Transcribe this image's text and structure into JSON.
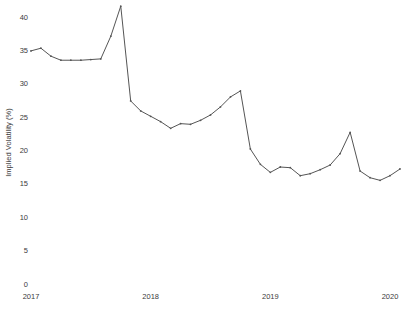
{
  "chart_data": {
    "type": "line",
    "title": "",
    "xlabel": "",
    "ylabel": "Implied Volatility (%)",
    "ylim": [
      0,
      42.5
    ],
    "yticks": [
      0,
      5,
      10,
      15,
      20,
      25,
      30,
      35,
      40
    ],
    "ytick_labels": [
      "0",
      "5",
      "10",
      "15",
      "20",
      "25",
      "30",
      "35",
      "40"
    ],
    "xlim": [
      2017.0,
      2020.08
    ],
    "xticks": [
      2017,
      2018,
      2019,
      2020
    ],
    "xtick_labels": [
      "2017",
      "2018",
      "2019",
      "2020"
    ],
    "grid": false,
    "legend": "none",
    "marker": "point",
    "line_color": "#555555",
    "background_color": "#ffffff",
    "series": [
      {
        "name": "Implied Volatility",
        "x": [
          2017.0,
          2017.083,
          2017.167,
          2017.25,
          2017.333,
          2017.417,
          2017.5,
          2017.583,
          2017.667,
          2017.75,
          2017.833,
          2017.917,
          2018.0,
          2018.083,
          2018.167,
          2018.25,
          2018.333,
          2018.417,
          2018.5,
          2018.583,
          2018.667,
          2018.75,
          2018.833,
          2018.917,
          2019.0,
          2019.083,
          2019.167,
          2019.25,
          2019.333,
          2019.417,
          2019.5,
          2019.583,
          2019.667,
          2019.75,
          2019.833,
          2019.917,
          2020.0,
          2020.083
        ],
        "values": [
          35.0,
          35.4,
          34.2,
          33.6,
          33.6,
          33.6,
          33.7,
          33.8,
          37.2,
          41.7,
          27.5,
          26.0,
          25.2,
          24.4,
          23.4,
          24.1,
          24.0,
          24.6,
          25.4,
          26.6,
          28.1,
          29.0,
          20.3,
          18.0,
          16.8,
          17.6,
          17.5,
          16.3,
          16.6,
          17.2,
          17.9,
          19.6,
          22.8,
          17.0,
          16.0,
          15.6,
          16.3,
          17.3
        ]
      }
    ],
    "annotations": []
  },
  "caption": {
    "text": ""
  }
}
